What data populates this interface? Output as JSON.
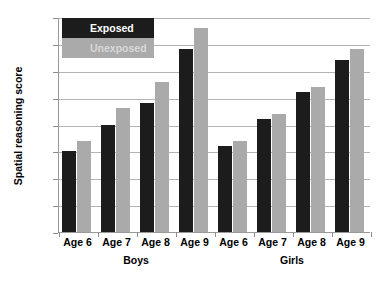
{
  "chart_data": {
    "type": "bar",
    "title": "",
    "subtitle": "",
    "xlabel": "",
    "ylabel": "Spatial reasoning score",
    "ylim": [
      0,
      40
    ],
    "ytick_step": 5,
    "yticks": [
      0,
      5,
      10,
      15,
      20,
      25,
      30,
      35,
      40
    ],
    "ytick_labels": [
      "0",
      "5",
      "10",
      "15",
      "20",
      "25",
      "30",
      "35",
      "40"
    ],
    "grid": true,
    "legend_position": "top-left",
    "categories": [
      "Age 6",
      "Age 7",
      "Age 8",
      "Age 9",
      "Age 6",
      "Age 7",
      "Age 8",
      "Age 9"
    ],
    "group_labels": [
      {
        "label": "Boys",
        "span": [
          0,
          3
        ]
      },
      {
        "label": "Girls",
        "span": [
          4,
          7
        ]
      }
    ],
    "series": [
      {
        "name": "Exposed",
        "color": "#1c1c1c",
        "values": [
          15,
          20,
          24,
          34,
          16,
          21,
          26,
          32
        ]
      },
      {
        "name": "Unexposed",
        "color": "#aaaaaa",
        "values": [
          17,
          23,
          28,
          38,
          17,
          22,
          27,
          34
        ]
      }
    ]
  }
}
